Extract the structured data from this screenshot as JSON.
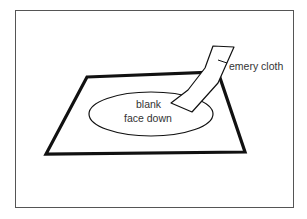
{
  "diagram": {
    "labels": {
      "emery_cloth": "emery cloth",
      "blank_line1": "blank",
      "blank_line2": "face down"
    },
    "colors": {
      "stroke": "#111111",
      "frame": "#555555",
      "text": "#333333",
      "background": "#ffffff"
    }
  }
}
